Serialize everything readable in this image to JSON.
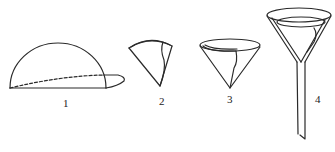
{
  "diagram": {
    "steps": [
      {
        "label": "1",
        "depicts": "circular filter paper folded in half, then folded again (dashed fold line)"
      },
      {
        "label": "2",
        "depicts": "paper folded into a quarter sector"
      },
      {
        "label": "3",
        "depicts": "sector opened into a cone"
      },
      {
        "label": "4",
        "depicts": "cone placed inside a funnel with stem"
      }
    ],
    "colors": {
      "stroke": "#2a2a2a",
      "background": "#ffffff"
    }
  }
}
